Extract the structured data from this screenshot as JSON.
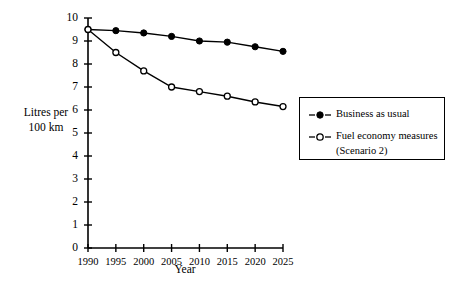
{
  "chart_data": {
    "type": "line",
    "title": "",
    "xlabel": "Year",
    "ylabel": "Litres per 100 km",
    "ylabel_lines": [
      "Litres per",
      "100 km"
    ],
    "categories": [
      "1990",
      "1995",
      "2000",
      "2005",
      "2010",
      "2015",
      "2020",
      "2025"
    ],
    "x": [
      1990,
      1995,
      2000,
      2005,
      2010,
      2015,
      2020,
      2025
    ],
    "xlim": [
      1990,
      2025
    ],
    "ylim": [
      0,
      10
    ],
    "ytick_labels": [
      "0",
      "1",
      "2",
      "3",
      "4",
      "5",
      "6",
      "7",
      "8",
      "9",
      "10"
    ],
    "yticks": [
      0,
      1,
      2,
      3,
      4,
      5,
      6,
      7,
      8,
      9,
      10
    ],
    "grid": false,
    "legend_position": "right",
    "series": [
      {
        "name": "Business as usual",
        "marker": "filled-circle",
        "line_style": "solid",
        "color": "#000000",
        "values": [
          9.5,
          9.45,
          9.35,
          9.2,
          9.0,
          8.95,
          8.75,
          8.55
        ]
      },
      {
        "name": "Fuel economy measures (Scenario 2)",
        "name_lines": [
          "Fuel economy measures",
          "(Scenario 2)"
        ],
        "marker": "open-circle",
        "line_style": "solid",
        "color": "#000000",
        "values": [
          9.5,
          8.5,
          7.7,
          7.0,
          6.8,
          6.6,
          6.35,
          6.15
        ]
      }
    ]
  },
  "axes": {
    "y_axis_label_line1": "Litres per",
    "y_axis_label_line2": "100 km",
    "x_axis_title": "Year"
  },
  "legend": {
    "items": [
      {
        "label": "Business as usual",
        "marker": "filled-circle"
      },
      {
        "label": "Fuel economy measures",
        "label2": "(Scenario 2)",
        "marker": "open-circle"
      }
    ]
  },
  "colors": {
    "foreground": "#000000",
    "background": "#ffffff"
  }
}
